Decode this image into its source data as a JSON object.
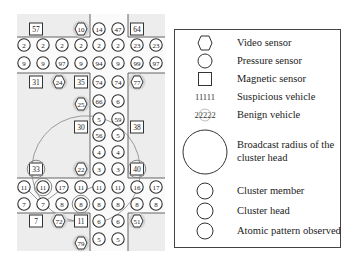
{
  "legend": {
    "items": [
      {
        "icon": "hexagon-icon",
        "label": "Video sensor"
      },
      {
        "icon": "circle-icon",
        "label": "Pressure sensor"
      },
      {
        "icon": "square-icon",
        "label": "Magnetic sensor"
      },
      {
        "icon_text": "11111",
        "label": "Suspicious vehicle"
      },
      {
        "icon_text": "22222",
        "label": "Benign vehicle"
      },
      {
        "icon": "large-circle-icon",
        "label": "Broadcast radius of the cluster head"
      },
      {
        "icon": "circle-icon",
        "label": "Cluster member"
      },
      {
        "icon": "circle-icon",
        "label": "Cluster head"
      },
      {
        "icon": "circle-icon",
        "label": "Atomic pattern observed"
      }
    ]
  },
  "map": {
    "colors": {
      "background": "#e8e8e8",
      "road": "#f4f4f4",
      "line": "#555555",
      "node_fill": "#ffffff",
      "highlight": "#9a9a9a"
    },
    "magnetic_sensors": [
      {
        "label": "57",
        "x": 36,
        "y": 29
      },
      {
        "label": "64",
        "x": 137,
        "y": 29
      },
      {
        "label": "31",
        "x": 36,
        "y": 82
      },
      {
        "label": "35",
        "x": 81,
        "y": 82
      },
      {
        "label": "30",
        "x": 81,
        "y": 127
      },
      {
        "label": "38",
        "x": 137,
        "y": 127
      },
      {
        "label": "33",
        "x": 36,
        "y": 169
      },
      {
        "label": "40",
        "x": 137,
        "y": 169
      },
      {
        "label": "7",
        "x": 36,
        "y": 221
      },
      {
        "label": "11",
        "x": 81,
        "y": 221
      }
    ],
    "video_sensors": [
      {
        "label": "10",
        "x": 81,
        "y": 29
      },
      {
        "label": "24",
        "x": 59,
        "y": 82
      },
      {
        "label": "77",
        "x": 137,
        "y": 82
      },
      {
        "label": "25",
        "x": 81,
        "y": 104
      },
      {
        "label": "22",
        "x": 81,
        "y": 169
      },
      {
        "label": "72",
        "x": 59,
        "y": 221
      },
      {
        "label": "51",
        "x": 137,
        "y": 221
      },
      {
        "label": "79",
        "x": 81,
        "y": 243
      }
    ],
    "vehicles": [
      {
        "label": "14",
        "x": 99,
        "y": 29
      },
      {
        "label": "47",
        "x": 118,
        "y": 29
      },
      {
        "label": "2",
        "x": 24,
        "y": 45
      },
      {
        "label": "2",
        "x": 43,
        "y": 45
      },
      {
        "label": "2",
        "x": 62,
        "y": 45
      },
      {
        "label": "2",
        "x": 81,
        "y": 45
      },
      {
        "label": "2",
        "x": 99,
        "y": 45
      },
      {
        "label": "2",
        "x": 118,
        "y": 45
      },
      {
        "label": "23",
        "x": 137,
        "y": 45
      },
      {
        "label": "23",
        "x": 156,
        "y": 45
      },
      {
        "label": "9",
        "x": 24,
        "y": 63
      },
      {
        "label": "9",
        "x": 43,
        "y": 63
      },
      {
        "label": "97",
        "x": 62,
        "y": 63
      },
      {
        "label": "9",
        "x": 81,
        "y": 63
      },
      {
        "label": "94",
        "x": 99,
        "y": 63
      },
      {
        "label": "9",
        "x": 118,
        "y": 63
      },
      {
        "label": "99",
        "x": 137,
        "y": 63
      },
      {
        "label": "97",
        "x": 156,
        "y": 63
      },
      {
        "label": "74",
        "x": 99,
        "y": 82
      },
      {
        "label": "74",
        "x": 118,
        "y": 82
      },
      {
        "label": "66",
        "x": 99,
        "y": 101
      },
      {
        "label": "6",
        "x": 118,
        "y": 101
      },
      {
        "label": "5",
        "x": 99,
        "y": 119
      },
      {
        "label": "59",
        "x": 118,
        "y": 119
      },
      {
        "label": "56",
        "x": 99,
        "y": 135
      },
      {
        "label": "5",
        "x": 118,
        "y": 135
      },
      {
        "label": "4",
        "x": 99,
        "y": 152
      },
      {
        "label": "4",
        "x": 118,
        "y": 152
      },
      {
        "label": "3",
        "x": 99,
        "y": 169
      },
      {
        "label": "3",
        "x": 118,
        "y": 169
      },
      {
        "label": "11",
        "x": 24,
        "y": 187
      },
      {
        "label": "11",
        "x": 43,
        "y": 187
      },
      {
        "label": "17",
        "x": 62,
        "y": 187
      },
      {
        "label": "11",
        "x": 81,
        "y": 187
      },
      {
        "label": "11",
        "x": 99,
        "y": 187
      },
      {
        "label": "11",
        "x": 118,
        "y": 187
      },
      {
        "label": "16",
        "x": 137,
        "y": 187
      },
      {
        "label": "17",
        "x": 156,
        "y": 187
      },
      {
        "label": "7",
        "x": 24,
        "y": 204
      },
      {
        "label": "7",
        "x": 43,
        "y": 204
      },
      {
        "label": "8",
        "x": 62,
        "y": 204
      },
      {
        "label": "8",
        "x": 81,
        "y": 204
      },
      {
        "label": "8",
        "x": 99,
        "y": 204
      },
      {
        "label": "8",
        "x": 118,
        "y": 204
      },
      {
        "label": "8",
        "x": 137,
        "y": 204
      },
      {
        "label": "8",
        "x": 156,
        "y": 204
      },
      {
        "label": "6",
        "x": 99,
        "y": 221
      },
      {
        "label": "6",
        "x": 118,
        "y": 221
      },
      {
        "label": "5",
        "x": 99,
        "y": 239
      },
      {
        "label": "5",
        "x": 118,
        "y": 239
      }
    ]
  }
}
